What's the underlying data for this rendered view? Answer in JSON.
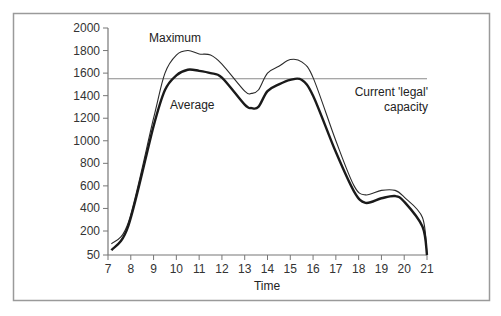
{
  "chart_data": {
    "type": "line",
    "title": "",
    "xlabel": "Time",
    "ylabel": "",
    "xlim": [
      7,
      21
    ],
    "ylim": [
      50,
      2000
    ],
    "x_ticks": [
      7,
      8,
      9,
      10,
      11,
      12,
      13,
      14,
      15,
      16,
      17,
      18,
      19,
      20,
      21
    ],
    "x_tick_labels": [
      "7",
      "8",
      "9",
      "10",
      "11",
      "12",
      "13",
      "14",
      "15",
      "16",
      "17",
      "18",
      "19",
      "20",
      "21"
    ],
    "y_ticks": [
      50,
      200,
      400,
      600,
      800,
      1000,
      1200,
      1400,
      1600,
      1800,
      2000
    ],
    "y_tick_labels": [
      "50",
      "200",
      "400",
      "600",
      "800",
      "1000",
      "1200",
      "1400",
      "1600",
      "1800",
      "2000"
    ],
    "grid": false,
    "legend": "none (series labelled inline)",
    "series": [
      {
        "name": "Maximum",
        "style": "thin",
        "x": [
          7.15,
          7.9,
          9,
          9.5,
          10,
          10.5,
          11,
          11.5,
          12,
          13,
          13.3,
          13.6,
          14,
          14.5,
          15,
          15.5,
          16,
          17,
          17.8,
          18.3,
          19,
          19.6,
          20,
          20.8,
          21
        ],
        "values": [
          120,
          280,
          1200,
          1600,
          1760,
          1800,
          1770,
          1760,
          1680,
          1440,
          1420,
          1450,
          1600,
          1660,
          1720,
          1700,
          1560,
          1000,
          600,
          520,
          560,
          560,
          500,
          320,
          50
        ]
      },
      {
        "name": "Average",
        "style": "thick",
        "x": [
          7.15,
          7.9,
          9,
          9.5,
          10,
          10.5,
          11,
          11.5,
          12,
          13,
          13.3,
          13.6,
          14,
          14.5,
          15,
          15.5,
          16,
          17,
          17.8,
          18.3,
          19,
          19.6,
          20,
          20.8,
          21
        ],
        "values": [
          80,
          250,
          1130,
          1450,
          1580,
          1630,
          1620,
          1600,
          1560,
          1320,
          1290,
          1300,
          1440,
          1500,
          1540,
          1540,
          1400,
          900,
          550,
          450,
          490,
          510,
          460,
          240,
          50
        ]
      }
    ],
    "reference_lines": [
      {
        "name": "Current 'legal' capacity",
        "value": 1550
      }
    ],
    "annotations": {
      "maximum_label": "Maximum",
      "average_label": "Average",
      "capacity_label_line1": "Current 'legal'",
      "capacity_label_line2": "capacity"
    }
  }
}
